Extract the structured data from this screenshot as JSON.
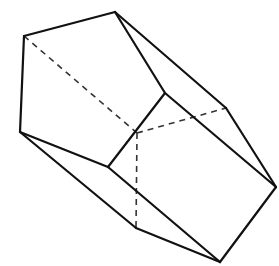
{
  "figure": {
    "type": "pentagonal-prism",
    "stroke_color": "#111111",
    "background": "#ffffff",
    "vertices": {
      "A": [
        24,
        36
      ],
      "B": [
        115,
        12
      ],
      "C": [
        165,
        93
      ],
      "D": [
        108,
        167
      ],
      "E": [
        20,
        132
      ],
      "F": [
        137,
        133
      ],
      "G": [
        226,
        108
      ],
      "H": [
        276,
        187
      ],
      "I": [
        220,
        262
      ],
      "J": [
        136,
        228
      ]
    },
    "solid_edges": [
      [
        "A",
        "B"
      ],
      [
        "B",
        "C"
      ],
      [
        "C",
        "D"
      ],
      [
        "D",
        "E"
      ],
      [
        "E",
        "A"
      ],
      [
        "B",
        "G"
      ],
      [
        "G",
        "H"
      ],
      [
        "H",
        "I"
      ],
      [
        "I",
        "J"
      ],
      [
        "C",
        "H"
      ],
      [
        "D",
        "I"
      ],
      [
        "E",
        "J"
      ]
    ],
    "dashed_edges": [
      [
        "A",
        "F"
      ],
      [
        "F",
        "G"
      ],
      [
        "F",
        "J"
      ]
    ]
  }
}
